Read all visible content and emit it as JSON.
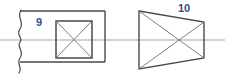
{
  "diagram": {
    "type": "engineering-cross-section-drawing",
    "canvas": {
      "width": 225,
      "height": 77,
      "background": "#ffffff"
    },
    "colors": {
      "outline": "#4a4a4a",
      "thin_line": "#6f6f6f",
      "centerline": "#a8a8a8",
      "label": "#2b4d91"
    },
    "labels": [
      {
        "id": "label-9",
        "text": "9",
        "x": 36,
        "y": 26,
        "color": "#2b4d91"
      },
      {
        "id": "label-10",
        "text": "10",
        "x": 178,
        "y": 12,
        "color": "#2b4d91"
      }
    ],
    "shapes": {
      "outer_rectangle": {
        "name": "outer-rectangle",
        "x": 20,
        "y": 11,
        "width": 85,
        "height": 51,
        "stroke": "#4a4a4a",
        "stroke_width": 1.4,
        "fill": "none"
      },
      "break_line": {
        "name": "wavy-break-line",
        "description": "vertical squiggly break line at left edge of outer rectangle",
        "x": 20,
        "y_top": 11,
        "y_bottom": 72,
        "stroke": "#4a4a4a",
        "stroke_width": 1.2
      },
      "inner_square": {
        "name": "inner-square",
        "x": 56,
        "y": 21,
        "width": 36,
        "height": 37,
        "stroke": "#4a4a4a",
        "stroke_width": 1.4,
        "fill": "none",
        "diagonals": true
      },
      "trapezoid": {
        "name": "tapered-trapezoid",
        "points": "139,11 204,22 204,58 139,69",
        "stroke": "#4a4a4a",
        "stroke_width": 1.3,
        "fill": "none",
        "diagonals": true
      },
      "centerline": {
        "name": "horizontal-centerline",
        "x1": 0,
        "y1": 40,
        "x2": 225,
        "y2": 40,
        "stroke": "#a8a8a8",
        "stroke_width": 1.2
      }
    }
  }
}
